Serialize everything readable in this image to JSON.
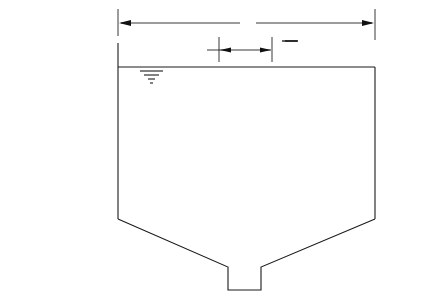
{
  "diagram": {
    "type": "engineering cross-section",
    "labels": {
      "diameter": "ø",
      "baffle_diameter": "ø/5",
      "freeboard": "1 in. ±",
      "baffle_depth": "h/2",
      "side_water_depth": "h",
      "influent_line1": "Influent",
      "influent_line2": "v = 2–4 fps",
      "baffle_line1": "Solid Circular",
      "baffle_line2": "Baffle"
    },
    "icons": {
      "water_surface": "water-surface-symbol",
      "flow_arrows": "curved-flow-arrows"
    }
  }
}
